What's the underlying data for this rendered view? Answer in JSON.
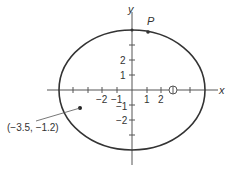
{
  "figure": {
    "axes": {
      "x_label": "x",
      "y_label": "y",
      "x_tick_labels": [
        "−2",
        "−1",
        "1",
        "2"
      ],
      "y_tick_labels": [
        "2",
        "1",
        "−1",
        "−2"
      ]
    },
    "ellipse": {
      "center": [
        0,
        0
      ],
      "semi_x": 5,
      "semi_y": 4
    },
    "point_p_label": "P",
    "point_label": "(−3.5, −1.2)",
    "focus_marker": "circle-plus"
  }
}
